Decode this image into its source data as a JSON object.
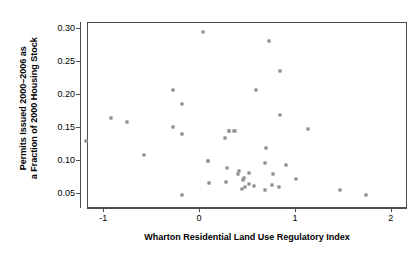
{
  "chart_data": {
    "type": "scatter",
    "title": "",
    "xlabel": "Wharton Residential Land Use Regulatory Index",
    "ylabel_line1": "Permits Issued 2000–2006 as",
    "ylabel_line2": "a Fraction of 2000 Housing Stock",
    "xlim": [
      -1.17,
      2.17
    ],
    "ylim": [
      0.028,
      0.3095
    ],
    "xticks": [
      -1,
      0,
      1,
      2
    ],
    "xticklabels": [
      "-1",
      "0",
      "1",
      "2"
    ],
    "yticks": [
      0.05,
      0.1,
      0.15,
      0.2,
      0.25,
      0.3
    ],
    "yticklabels": [
      "0.05",
      "0.10",
      "0.15",
      "0.20",
      "0.25",
      "0.30"
    ],
    "grid": false,
    "legend": null,
    "marker": "open-square",
    "marker_color": "#6b6b6b",
    "frame_color": "#4d4d4d",
    "n_points": 44,
    "x": [
      0.03,
      0.72,
      0.58,
      0.83,
      -0.73,
      -0.27,
      -0.75,
      -0.28,
      -0.19,
      -0.09,
      0.3,
      0.34,
      0.35,
      0.21,
      -1.19,
      -0.59,
      0.08,
      0.28,
      0.33,
      0.37,
      0.41,
      0.45,
      0.46,
      0.47,
      0.51,
      0.69,
      0.76,
      0.9,
      1.13,
      0.09,
      0.18,
      0.27,
      0.31,
      0.4,
      0.44,
      0.51,
      0.56,
      0.68,
      0.75,
      0.82,
      1.0,
      1.46,
      1.73,
      0.62
    ],
    "y": [
      0.2956,
      0.2819,
      0.2221,
      0.1985,
      0.1868,
      0.1809,
      0.1662,
      0.1574,
      0.1515,
      0.1485,
      0.1471,
      0.1471,
      0.1456,
      0.1397,
      0.1309,
      0.1103,
      0.1,
      0.0971,
      0.0941,
      0.0912,
      0.0897,
      0.0882,
      0.0868,
      0.0853,
      0.0838,
      0.0824,
      0.0809,
      0.0794,
      0.0779,
      0.0765,
      0.075,
      0.0735,
      0.0721,
      0.0706,
      0.0691,
      0.0676,
      0.0662,
      0.0647,
      0.0632,
      0.0618,
      0.0603,
      0.0574,
      0.0515,
      0.0485
    ],
    "points": [
      {
        "x": 0.03,
        "y": 0.2956
      },
      {
        "x": 0.72,
        "y": 0.2819
      },
      {
        "x": 0.83,
        "y": 0.2368
      },
      {
        "x": 0.58,
        "y": 0.2074
      },
      {
        "x": -0.28,
        "y": 0.2074
      },
      {
        "x": -0.19,
        "y": 0.1868
      },
      {
        "x": -0.93,
        "y": 0.1662
      },
      {
        "x": -0.76,
        "y": 0.1603
      },
      {
        "x": -0.28,
        "y": 0.1515
      },
      {
        "x": 0.3,
        "y": 0.1456
      },
      {
        "x": 0.36,
        "y": 0.1456
      },
      {
        "x": -0.19,
        "y": 0.1412
      },
      {
        "x": -1.19,
        "y": 0.1309
      },
      {
        "x": 0.3,
        "y": 0.1456
      },
      {
        "x": 0.35,
        "y": 0.1456
      },
      {
        "x": 0.26,
        "y": 0.1353
      },
      {
        "x": 0.83,
        "y": 0.1706
      },
      {
        "x": -0.59,
        "y": 0.1103
      },
      {
        "x": 0.08,
        "y": 0.1
      },
      {
        "x": 1.13,
        "y": 0.1485
      },
      {
        "x": 0.08,
        "y": 0.1
      },
      {
        "x": 0.69,
        "y": 0.1206
      },
      {
        "x": 0.68,
        "y": 0.0971
      },
      {
        "x": 0.9,
        "y": 0.0941
      },
      {
        "x": 0.28,
        "y": 0.0897
      },
      {
        "x": 0.27,
        "y": 0.0691
      },
      {
        "x": 0.09,
        "y": 0.0676
      },
      {
        "x": 0.41,
        "y": 0.0853
      },
      {
        "x": 0.46,
        "y": 0.075
      },
      {
        "x": 0.45,
        "y": 0.0721
      },
      {
        "x": 0.4,
        "y": 0.0809
      },
      {
        "x": 0.51,
        "y": 0.0824
      },
      {
        "x": 0.51,
        "y": 0.0662
      },
      {
        "x": 0.47,
        "y": 0.0618
      },
      {
        "x": 0.56,
        "y": 0.0632
      },
      {
        "x": 0.76,
        "y": 0.0809
      },
      {
        "x": 0.75,
        "y": 0.0647
      },
      {
        "x": 0.68,
        "y": 0.0574
      },
      {
        "x": 0.44,
        "y": 0.0588
      },
      {
        "x": 0.82,
        "y": 0.0618
      },
      {
        "x": 1.0,
        "y": 0.0735
      },
      {
        "x": 1.46,
        "y": 0.0574
      },
      {
        "x": 1.73,
        "y": 0.0485
      },
      {
        "x": -0.19,
        "y": 0.0485
      }
    ]
  }
}
